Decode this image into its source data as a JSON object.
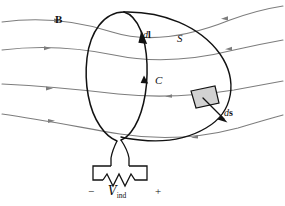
{
  "figure": {
    "width": 285,
    "height": 206,
    "background_color": "#ffffff"
  },
  "colors": {
    "field_line": "#7d7d7d",
    "contour": "#121212",
    "surface": "#121212",
    "wire": "#121212",
    "patch_fill": "#d2d2d2",
    "text": "#111111"
  },
  "labels": {
    "magnetic_field": "B",
    "line_element_d": "d",
    "line_element_vec": "l",
    "surface": "S",
    "contour": "C",
    "area_element_d": "d",
    "area_element_vec": "s",
    "terminal_negative": "−",
    "terminal_positive": "+",
    "emf_symbol": "V",
    "emf_subscript": "ind"
  },
  "elements": {
    "field_lines_count": 4,
    "contour_name": "loop-c",
    "surface_name": "surface-s",
    "area_patch_name": "area-element-patch",
    "circuit_name": "induced-emf-circuit"
  }
}
